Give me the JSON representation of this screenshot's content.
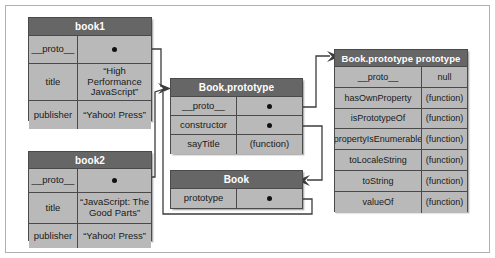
{
  "diagram": {
    "colors": {
      "header_bg": "#666666",
      "cell_bg": "#b9b9b9",
      "border": "#4a4a4a",
      "header_text": "#ffffff",
      "cell_text": "#1a1a1a",
      "frame_border": "#b0b0b0",
      "wire": "#3c3c3c"
    },
    "tables": [
      {
        "id": "book1",
        "title": "book1",
        "rows": [
          {
            "key": "__proto__",
            "value": "",
            "pointer": true
          },
          {
            "key": "title",
            "value": "“High Performance JavaScript”",
            "pointer": false
          },
          {
            "key": "publisher",
            "value": "“Yahoo! Press”",
            "pointer": false
          }
        ]
      },
      {
        "id": "book2",
        "title": "book2",
        "rows": [
          {
            "key": "__proto__",
            "value": "",
            "pointer": true
          },
          {
            "key": "title",
            "value": "“JavaScript: The Good Parts”",
            "pointer": false
          },
          {
            "key": "publisher",
            "value": "“Yahoo! Press”",
            "pointer": false
          }
        ]
      },
      {
        "id": "bookproto",
        "title": "Book.prototype",
        "rows": [
          {
            "key": "__proto__",
            "value": "",
            "pointer": true
          },
          {
            "key": "constructor",
            "value": "",
            "pointer": true
          },
          {
            "key": "sayTitle",
            "value": "(function)",
            "pointer": false
          }
        ]
      },
      {
        "id": "book",
        "title": "Book",
        "rows": [
          {
            "key": "prototype",
            "value": "",
            "pointer": true
          }
        ]
      },
      {
        "id": "bigproto",
        "title": "Book.prototype prototype",
        "rows": [
          {
            "key": "__proto__",
            "value": "null",
            "pointer": false
          },
          {
            "key": "hasOwnProperty",
            "value": "(function)",
            "pointer": false
          },
          {
            "key": "isPrototypeOf",
            "value": "(function)",
            "pointer": false
          },
          {
            "key": "propertyIsEnumerable",
            "value": "(function)",
            "pointer": false
          },
          {
            "key": "toLocaleString",
            "value": "(function)",
            "pointer": false
          },
          {
            "key": "toString",
            "value": "(function)",
            "pointer": false
          },
          {
            "key": "valueOf",
            "value": "(function)",
            "pointer": false
          }
        ]
      }
    ],
    "connections": [
      {
        "from": "book1.__proto__",
        "to": "Book.prototype"
      },
      {
        "from": "book2.__proto__",
        "to": "Book.prototype"
      },
      {
        "from": "Book.prototype.__proto__",
        "to": "Book.prototype prototype"
      },
      {
        "from": "Book.prototype.constructor",
        "to": "Book"
      },
      {
        "from": "Book.prototype",
        "to": "Book.prototype"
      }
    ]
  }
}
